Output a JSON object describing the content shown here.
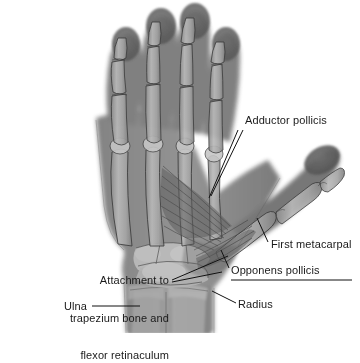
{
  "figure": {
    "kind": "annotated-radiograph",
    "background_color": "#ffffff",
    "label_color": "#1a1a1a",
    "leader_color": "#111111",
    "bone_color": "#8a8a8a",
    "soft_tissue_color": "#6e6e6e"
  },
  "labels": {
    "adductor_pollicis": "Adductor pollicis",
    "first_metacarpal": "First metacarpal",
    "opponens_pollicis": "Opponens pollicis",
    "attachment_line_1": "Attachment to",
    "attachment_line_2": "trapezium bone and",
    "attachment_line_3": "flexor retinaculum",
    "ulna": "Ulna",
    "radius": "Radius"
  }
}
